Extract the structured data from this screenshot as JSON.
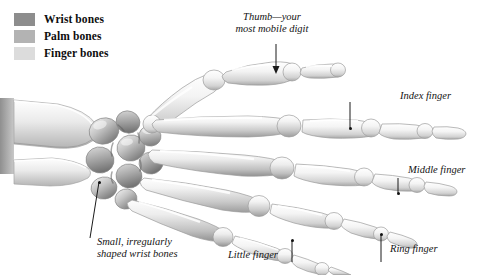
{
  "figure": {
    "view": "dorsal (palm down), right hand, fingers pointing right",
    "style": "grayscale anatomical illustration on white background"
  },
  "legend": {
    "items": [
      {
        "label": "Wrist bones",
        "color": "#8d8d8d",
        "icon": "color-swatch"
      },
      {
        "label": "Palm bones",
        "color": "#b3b3b3",
        "icon": "color-swatch"
      },
      {
        "label": "Finger bones",
        "color": "#dcdcdc",
        "icon": "color-swatch"
      }
    ]
  },
  "annotations": [
    {
      "id": "thumb",
      "line1": "Thumb—your",
      "line2": "most mobile digit"
    },
    {
      "id": "index",
      "line1": "Index finger",
      "line2": ""
    },
    {
      "id": "middle",
      "line1": "Middle finger",
      "line2": ""
    },
    {
      "id": "ring",
      "line1": "Ring finger",
      "line2": ""
    },
    {
      "id": "little",
      "line1": "Little finger",
      "line2": ""
    },
    {
      "id": "carpal",
      "line1": "Small, irregularly",
      "line2": "shaped wrist bones"
    }
  ],
  "colors": {
    "background": "#ffffff",
    "bone_light": "#fbfbfb",
    "bone_mid": "#d2d2d2",
    "bone_shadow": "#8f8f8f",
    "bone_dark": "#6e6e6e",
    "outline": "#9a9a9a",
    "leader_line": "#1a1a1a",
    "text": "#141414"
  }
}
